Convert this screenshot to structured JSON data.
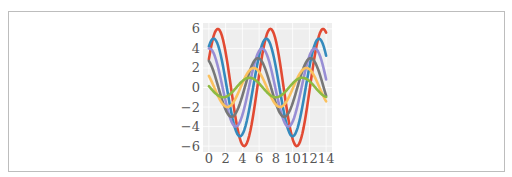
{
  "chart_data": {
    "type": "line",
    "title": "",
    "xlabel": "",
    "ylabel": "",
    "xlim": [
      -0.7,
      14.7
    ],
    "ylim": [
      -6.6,
      6.6
    ],
    "grid": true,
    "legend": "none",
    "x_ticks": [
      "0",
      "2",
      "4",
      "6",
      "8",
      "10",
      "12",
      "14"
    ],
    "x_tick_values": [
      0,
      2,
      4,
      6,
      8,
      10,
      12,
      14
    ],
    "y_ticks": [
      "6",
      "4",
      "2",
      "0",
      "−2",
      "−4",
      "−6"
    ],
    "y_tick_values": [
      6,
      4,
      2,
      0,
      -2,
      -4,
      -6
    ],
    "x_domain": [
      0,
      14
    ],
    "n_points": 100,
    "formula": "y = sin(x + i*0.5) * (7 - i)",
    "series": [
      {
        "name": "i=1",
        "i": 1,
        "amplitude": 6,
        "phase": 0.5,
        "color": "#E24A33"
      },
      {
        "name": "i=2",
        "i": 2,
        "amplitude": 5,
        "phase": 1.0,
        "color": "#348ABD"
      },
      {
        "name": "i=3",
        "i": 3,
        "amplitude": 4,
        "phase": 1.5,
        "color": "#988ED5"
      },
      {
        "name": "i=4",
        "i": 4,
        "amplitude": 3,
        "phase": 2.0,
        "color": "#777777"
      },
      {
        "name": "i=5",
        "i": 5,
        "amplitude": 2,
        "phase": 2.5,
        "color": "#FBC15E"
      },
      {
        "name": "i=6",
        "i": 6,
        "amplitude": 1,
        "phase": 3.0,
        "color": "#8EBA42"
      }
    ],
    "background": "#EEEEEE",
    "grid_color": "#FFFFFF"
  }
}
